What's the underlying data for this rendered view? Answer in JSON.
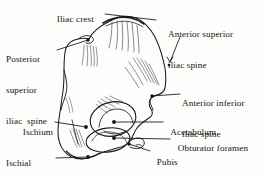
{
  "figure": {
    "style": "line-drawing",
    "ink_color": "#1a1a1a",
    "background_color": "#fdfdfc"
  },
  "labels": [
    {
      "id": "iliac-crest",
      "text": "Iliac crest",
      "lines": [
        "Iliac crest"
      ],
      "x": 52,
      "y": 8,
      "align": "left",
      "leader": {
        "from": [
          108,
          14
        ],
        "to": [
          155,
          19
        ]
      },
      "marker": "none"
    },
    {
      "id": "posterior-superior-iliac-spine",
      "text": "Posterior superior iliac spine",
      "lines": [
        "Posterior",
        "superior",
        "iliac  spine"
      ],
      "x": 6,
      "y": 38,
      "align": "left",
      "leader": {
        "from": [
          58,
          48
        ],
        "to": [
          89,
          40
        ]
      },
      "marker": "dot"
    },
    {
      "id": "anterior-superior-iliac-spine",
      "text": "Anterior superior iliac spine",
      "lines": [
        "Anterior superior",
        "iliac spine"
      ],
      "x": 168,
      "y": 13,
      "align": "left",
      "leader": {
        "from": [
          178,
          36
        ],
        "to": [
          168,
          66
        ]
      },
      "marker": "arrow"
    },
    {
      "id": "anterior-inferior-iliac-spine",
      "text": "Anterior inferior iliac spine",
      "lines": [
        "Anterior inferior",
        "iliac spine"
      ],
      "x": 182,
      "y": 82,
      "align": "left",
      "leader": {
        "from": [
          180,
          92
        ],
        "to": [
          153,
          96
        ]
      },
      "marker": "dot"
    },
    {
      "id": "acetabulum",
      "text": "Acetabulum",
      "lines": [
        "Acetabulum"
      ],
      "x": 166,
      "y": 118,
      "align": "left",
      "leader": {
        "from": [
          162,
          123
        ],
        "to": [
          113,
          123
        ]
      },
      "marker": "dot"
    },
    {
      "id": "obturator-foramen",
      "text": "Obturator foramen",
      "lines": [
        "Obturator foramen"
      ],
      "x": 172,
      "y": 135,
      "align": "left",
      "leader": {
        "from": [
          168,
          140
        ],
        "to": [
          113,
          139
        ]
      },
      "marker": "dot"
    },
    {
      "id": "pubis",
      "text": "Pubis",
      "lines": [
        "Pubis"
      ],
      "x": 152,
      "y": 150,
      "align": "left",
      "leader": {
        "from": [
          150,
          153
        ],
        "to": [
          128,
          145
        ]
      },
      "marker": "dot"
    },
    {
      "id": "ischium",
      "text": "Ischium",
      "lines": [
        "Ischium"
      ],
      "x": 18,
      "y": 118,
      "align": "left",
      "leader": {
        "from": [
          56,
          123
        ],
        "to": [
          85,
          126
        ]
      },
      "marker": "dot"
    },
    {
      "id": "ischial-tuberosity",
      "text": "Ischial tuberosity",
      "lines": [
        "Ischial",
        "tuberosity"
      ],
      "x": 8,
      "y": 140,
      "align": "left",
      "leader": {
        "from": [
          58,
          157
        ],
        "to": [
          87,
          156
        ]
      },
      "marker": "dot"
    }
  ],
  "structures": [
    {
      "id": "ilium-body",
      "name": "ilium"
    },
    {
      "id": "acetabulum-socket",
      "name": "acetabulum"
    },
    {
      "id": "obturator-opening",
      "name": "obturator foramen"
    },
    {
      "id": "ischial-body",
      "name": "ischium"
    },
    {
      "id": "pubic-body",
      "name": "pubis"
    },
    {
      "id": "greater-sciatic-notch",
      "name": "greater sciatic notch"
    }
  ]
}
